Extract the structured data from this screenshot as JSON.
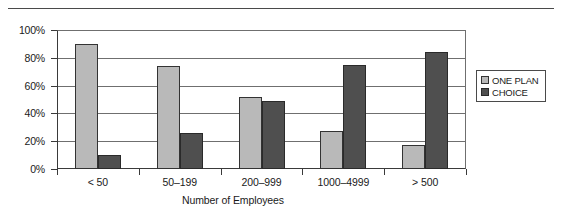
{
  "chart_data": {
    "type": "bar",
    "title": "",
    "xlabel": "Number of Employees",
    "ylabel": "",
    "categories": [
      "< 50",
      "50–199",
      "200–999",
      "1000–4999",
      "> 500"
    ],
    "series": [
      {
        "name": "ONE PLAN",
        "color": "#b9b9b9",
        "values": [
          90,
          74,
          52,
          27,
          17
        ]
      },
      {
        "name": "CHOICE",
        "color": "#4f4f4f",
        "values": [
          10,
          26,
          49,
          75,
          84
        ]
      }
    ],
    "ylim": [
      0,
      100
    ],
    "ytick_labels": [
      "100%",
      "80%",
      "60%",
      "40%",
      "20%",
      "0%"
    ],
    "ytick_values": [
      100,
      80,
      60,
      40,
      20,
      0
    ],
    "grid": "horizontal",
    "legend_position": "right"
  },
  "legend": {
    "items": [
      {
        "label": "ONE PLAN",
        "color": "#b9b9b9"
      },
      {
        "label": "CHOICE",
        "color": "#4f4f4f"
      }
    ]
  }
}
